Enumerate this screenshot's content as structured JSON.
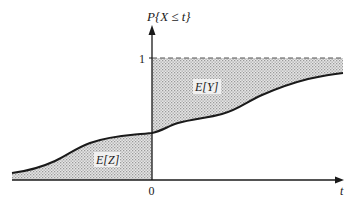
{
  "figure": {
    "y_axis_label": "P{X ≤ t}",
    "x_axis_label": "t",
    "origin_label": "0",
    "level_one_label": "1",
    "region_labels": {
      "upper_right": "E[Y]",
      "lower_left": "E[Z]"
    },
    "colors": {
      "ink": "#1a1a1a",
      "shade": "#cfcfcf",
      "dash": "#555555"
    }
  }
}
